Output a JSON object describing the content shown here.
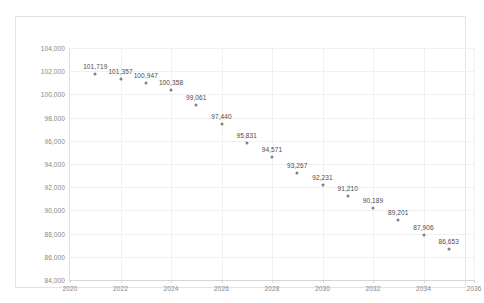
{
  "top_strip": {
    "text": "———  —————  ———  ————  ———  ——"
  },
  "chart_data": {
    "type": "scatter",
    "title": "",
    "subtitle": "",
    "xlabel": "",
    "ylabel": "",
    "xlim": [
      2020,
      2036
    ],
    "ylim": [
      84000,
      104000
    ],
    "grid": true,
    "legend": false,
    "x_ticks": [
      "2020",
      "2022",
      "2024",
      "2026",
      "2028",
      "2030",
      "2032",
      "2034",
      "2036"
    ],
    "x_tick_values": [
      2020,
      2022,
      2024,
      2026,
      2028,
      2030,
      2032,
      2034,
      2036
    ],
    "y_ticks": [
      "84,000",
      "86,000",
      "88,000",
      "90,000",
      "92,000",
      "94,000",
      "96,000",
      "98,000",
      "100,000",
      "102,000",
      "104,000"
    ],
    "y_tick_values": [
      84000,
      86000,
      88000,
      90000,
      92000,
      94000,
      96000,
      98000,
      100000,
      102000,
      104000
    ],
    "marker_color": "#808085",
    "label_color": "#4a4a4d",
    "x": [
      2021,
      2022,
      2023,
      2024,
      2025,
      2026,
      2027,
      2028,
      2029,
      2030,
      2031,
      2032,
      2033,
      2034,
      2035
    ],
    "values": [
      101719,
      101357,
      100947,
      100358,
      99061,
      97440,
      95831,
      94571,
      93267,
      92231,
      91210,
      90189,
      89201,
      87906,
      86653
    ],
    "point_labels": [
      "101,719",
      "101,357",
      "100,947",
      "100,358",
      "99,061",
      "97,440",
      "95,831",
      "94,571",
      "93,267",
      "92,231",
      "91,210",
      "90,189",
      "89,201",
      "87,906",
      "86,653"
    ]
  }
}
